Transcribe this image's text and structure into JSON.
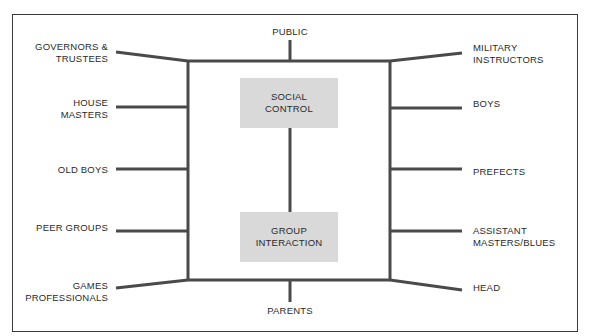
{
  "diagram": {
    "type": "relationship-network",
    "center": {
      "top_box": {
        "line1": "SOCIAL",
        "line2": "CONTROL"
      },
      "bottom_box": {
        "line1": "GROUP",
        "line2": "INTERACTION"
      }
    },
    "top_label": "PUBLIC",
    "bottom_label": "PARENTS",
    "left_labels": [
      {
        "line1": "GOVERNORS &",
        "line2": "TRUSTEES"
      },
      {
        "line1": "HOUSE",
        "line2": "MASTERS"
      },
      {
        "line1": "OLD BOYS",
        "line2": ""
      },
      {
        "line1": "PEER GROUPS",
        "line2": ""
      },
      {
        "line1": "GAMES",
        "line2": "PROFESSIONALS"
      }
    ],
    "right_labels": [
      {
        "line1": "MILITARY",
        "line2": "INSTRUCTORS"
      },
      {
        "line1": "BOYS",
        "line2": ""
      },
      {
        "line1": "PREFECTS",
        "line2": ""
      },
      {
        "line1": "ASSISTANT",
        "line2": "MASTERS/BLUES"
      },
      {
        "line1": "HEAD",
        "line2": ""
      }
    ],
    "colors": {
      "line": "#4a4a4a",
      "box_fill": "#d9d9d9",
      "text": "#2a2a2a",
      "border": "#3a3a3a"
    }
  }
}
